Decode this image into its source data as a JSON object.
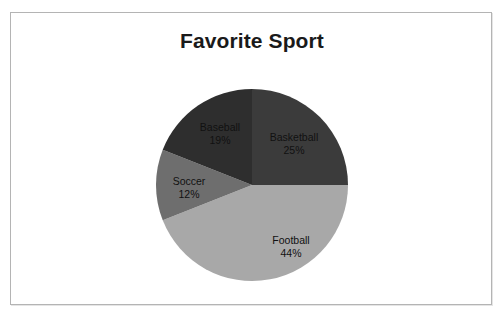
{
  "chart_data": {
    "type": "pie",
    "title": "Favorite Sport",
    "categories": [
      "Basketball",
      "Football",
      "Soccer",
      "Baseball"
    ],
    "values": [
      25,
      44,
      12,
      19
    ],
    "unit": "%",
    "start_angle_deg": 0,
    "direction": "clockwise",
    "legend": "none",
    "grid": false,
    "labels_position": "inside-slice",
    "slices": [
      {
        "label": "Basketball",
        "value": 25,
        "percent_text": "25%",
        "color": "#3b3b3b",
        "text_color": "#111111"
      },
      {
        "label": "Football",
        "value": 44,
        "percent_text": "44%",
        "color": "#a8a8a8",
        "text_color": "#111111"
      },
      {
        "label": "Soccer",
        "value": 12,
        "percent_text": "12%",
        "color": "#6e6e6e",
        "text_color": "#111111"
      },
      {
        "label": "Baseball",
        "value": 19,
        "percent_text": "19%",
        "color": "#2e2e2e",
        "text_color": "#111111"
      }
    ]
  },
  "frame": {
    "border_color": "#b4b4b4",
    "background": "#ffffff"
  },
  "page_background": "#ffffff"
}
